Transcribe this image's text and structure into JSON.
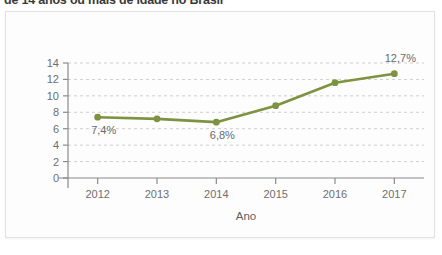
{
  "header": {
    "title": "de 14 anos ou mais de idade no Brasil"
  },
  "card": {
    "background_color": "#fdfdfd",
    "border_color": "#e2e2e2"
  },
  "chart_data": {
    "type": "line",
    "title": "",
    "xlabel": "Ano",
    "ylabel": "",
    "categories": [
      "2012",
      "2013",
      "2014",
      "2015",
      "2016",
      "2017"
    ],
    "values": [
      7.4,
      7.2,
      6.8,
      8.8,
      11.6,
      12.7
    ],
    "series": [
      {
        "name": "Taxa de desocupação",
        "values": [
          7.4,
          7.2,
          6.8,
          8.8,
          11.6,
          12.7
        ],
        "color": "#7d9340",
        "marker": "circle"
      }
    ],
    "ylim": [
      0,
      14
    ],
    "yticks": [
      0,
      2,
      4,
      6,
      8,
      10,
      12,
      14
    ],
    "ytick_labels": [
      "0",
      "2",
      "4",
      "6",
      "8",
      "10",
      "12",
      "14"
    ],
    "xtick_labels": [
      "2012",
      "2013",
      "2014",
      "2015",
      "2016",
      "2017"
    ],
    "grid": {
      "horizontal": true,
      "vertical": false,
      "style": "dashed",
      "color": "#cfcfcf"
    },
    "legend": {
      "visible": false,
      "position": "none"
    },
    "annotations": [
      {
        "text": "7,4%",
        "x_category": "2012",
        "value": 7.4,
        "position": "below"
      },
      {
        "text": "6,8%",
        "x_category": "2014",
        "value": 6.8,
        "position": "below"
      },
      {
        "text": "12,7%",
        "x_category": "2017",
        "value": 12.7,
        "position": "above"
      }
    ],
    "axis_color": "#8a8a8a",
    "line_color": "#7d9340"
  }
}
